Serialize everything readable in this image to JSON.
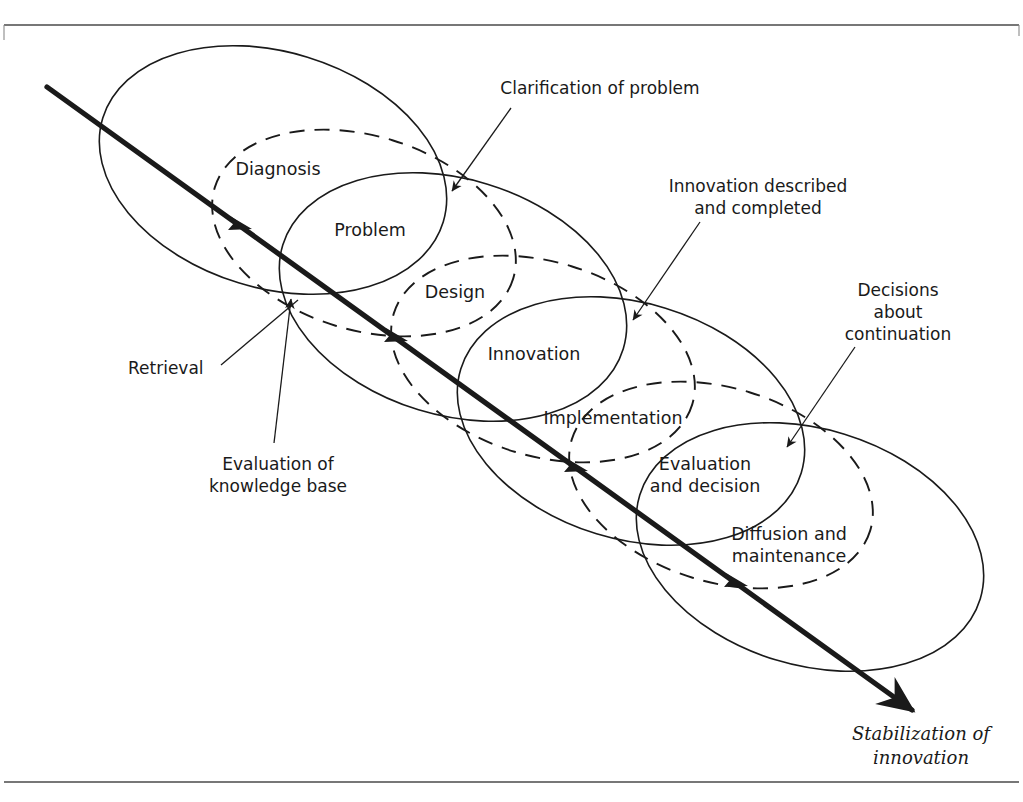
{
  "diagram": {
    "title_visible": false,
    "type": "overlapping-ellipse-process-diagram",
    "colors": {
      "ink": "#1a1a1a",
      "frame": "#4a4a4a",
      "background": "#ffffff"
    },
    "stage_labels": [
      {
        "id": "diagnosis",
        "text": "Diagnosis",
        "x": 278,
        "y": 175
      },
      {
        "id": "problem",
        "text": "Problem",
        "x": 370,
        "y": 236
      },
      {
        "id": "design",
        "text": "Design",
        "x": 455,
        "y": 298
      },
      {
        "id": "innovation",
        "text": "Innovation",
        "x": 534,
        "y": 360
      },
      {
        "id": "implementation",
        "text": "Implementation",
        "x": 613,
        "y": 424
      },
      {
        "id": "evaluation_and_decision_l1",
        "text": "Evaluation",
        "x": 705,
        "y": 470
      },
      {
        "id": "evaluation_and_decision_l2",
        "text": "and decision",
        "x": 705,
        "y": 492
      },
      {
        "id": "diffusion_l1",
        "text": "Diffusion and",
        "x": 789,
        "y": 540
      },
      {
        "id": "diffusion_l2",
        "text": "maintenance",
        "x": 789,
        "y": 562
      }
    ],
    "callouts": [
      {
        "id": "clarification-of-problem",
        "lines": [
          "Clarification of problem"
        ],
        "text_x": 600,
        "text_y": 94,
        "anchor": "middle",
        "leader": {
          "x1": 511,
          "y1": 108,
          "x2": 452,
          "y2": 191
        },
        "arrow_at": "end"
      },
      {
        "id": "innovation-described-and-completed",
        "lines": [
          "Innovation described",
          "and completed"
        ],
        "text_x": 758,
        "text_y": 192,
        "anchor": "middle",
        "line_gap": 22,
        "leader": {
          "x1": 700,
          "y1": 222,
          "x2": 633,
          "y2": 320
        },
        "arrow_at": "end"
      },
      {
        "id": "decisions-about-continuation",
        "lines": [
          "Decisions",
          "about",
          "continuation"
        ],
        "text_x": 898,
        "text_y": 296,
        "anchor": "middle",
        "line_gap": 22,
        "leader": {
          "x1": 855,
          "y1": 347,
          "x2": 787,
          "y2": 447
        },
        "arrow_at": "end"
      },
      {
        "id": "retrieval",
        "lines": [
          "Retrieval"
        ],
        "text_x": 128,
        "text_y": 374,
        "anchor": "start",
        "leader": {
          "x1": 221,
          "y1": 365,
          "x2": 298,
          "y2": 300
        },
        "arrow_at": "none"
      },
      {
        "id": "evaluation-of-knowledge-base",
        "lines": [
          "Evaluation of",
          "knowledge base"
        ],
        "text_x": 278,
        "text_y": 470,
        "anchor": "middle",
        "line_gap": 22,
        "leader": {
          "x1": 274,
          "y1": 443,
          "x2": 291,
          "y2": 299
        },
        "arrow_at": "end"
      }
    ],
    "axis_label": {
      "id": "stabilization-of-innovation",
      "lines": [
        "Stabilization of",
        "innovation"
      ],
      "text_x": 921,
      "text_y": 740,
      "line_gap": 24
    },
    "main_axis": {
      "label": "main progression arrow",
      "start": {
        "x": 47,
        "y": 87
      },
      "end": {
        "x": 912,
        "y": 710
      },
      "midpoint_arrow_positions": [
        0.22,
        0.4,
        0.585,
        0.77
      ]
    },
    "solid_ellipses": [
      {
        "id": "diagnosis-ellipse",
        "cx": 273,
        "cy": 170,
        "rx": 178,
        "ry": 118,
        "rotation": 17
      },
      {
        "id": "design-ellipse",
        "cx": 453,
        "cy": 297,
        "rx": 178,
        "ry": 118,
        "rotation": 17
      },
      {
        "id": "implementation-ellipse",
        "cx": 631,
        "cy": 421,
        "rx": 178,
        "ry": 118,
        "rotation": 17
      },
      {
        "id": "diffusion-ellipse",
        "cx": 810,
        "cy": 547,
        "rx": 178,
        "ry": 118,
        "rotation": 17
      }
    ],
    "dashed_ellipses": [
      {
        "id": "problem-ellipse",
        "cx": 364,
        "cy": 233,
        "rx": 156,
        "ry": 97,
        "rotation": 17
      },
      {
        "id": "innovation-ellipse",
        "cx": 543,
        "cy": 359,
        "rx": 156,
        "ry": 97,
        "rotation": 17
      },
      {
        "id": "evaluation-decision-ellipse",
        "cx": 721,
        "cy": 485,
        "rx": 156,
        "ry": 97,
        "rotation": 17
      }
    ],
    "frame": {
      "top_line_y": 25,
      "bottom_line_y": 782,
      "x_start": 4,
      "x_end": 1019
    }
  }
}
